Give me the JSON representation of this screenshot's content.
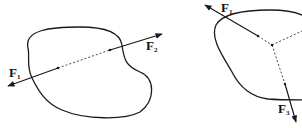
{
  "figures": [
    {
      "name": "two-force-body",
      "forces": [
        {
          "label": "F",
          "subscript": "1"
        },
        {
          "label": "F",
          "subscript": "2"
        }
      ]
    },
    {
      "name": "three-force-body",
      "forces": [
        {
          "label": "F",
          "subscript": "1"
        },
        {
          "label": "F",
          "subscript": "3"
        }
      ]
    }
  ],
  "colors": {
    "stroke": "#1a1a1a",
    "background": "#ffffff"
  }
}
